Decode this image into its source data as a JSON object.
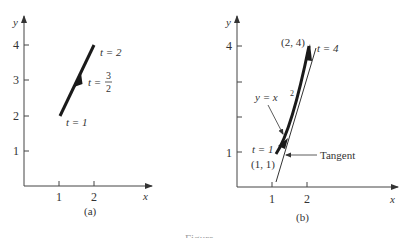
{
  "figure": {
    "caption_partial": "Figure",
    "panel_a": {
      "label": "(a)",
      "x_axis_label": "x",
      "y_axis_label": "y",
      "x_ticks": [
        "1",
        "2"
      ],
      "y_ticks": [
        "1",
        "2",
        "3",
        "4"
      ],
      "annotations": {
        "t_start": "t = 1",
        "t_mid_prefix": "t =",
        "t_mid_num": "3",
        "t_mid_den": "2",
        "t_end": "t = 2"
      }
    },
    "panel_b": {
      "label": "(b)",
      "x_axis_label": "x",
      "y_axis_label": "y",
      "x_ticks": [
        "1",
        "2"
      ],
      "y_ticks": [
        "1",
        "4"
      ],
      "annotations": {
        "point_end": "(2, 4)",
        "t_end": "t = 4",
        "curve_label": "y = x",
        "curve_exp": "2",
        "t_start": "t = 1",
        "point_start": "(1, 1)",
        "tangent": "Tangent"
      }
    }
  },
  "colors": {
    "axis": "#444444",
    "curve": "#1a1a1a",
    "text": "#333333"
  }
}
